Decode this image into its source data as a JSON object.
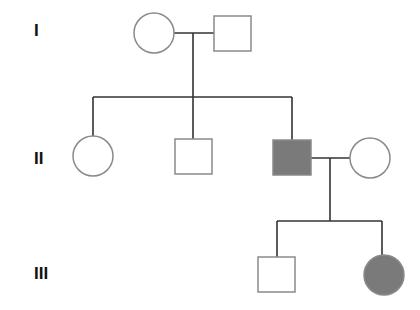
{
  "diagram": {
    "type": "pedigree-chart",
    "colors": {
      "affected_fill": "#7a7a7a",
      "unaffected_fill": "#ffffff",
      "outline": "#8a8a8a",
      "line": "#333333"
    },
    "generations": [
      {
        "label": "I",
        "members": [
          {
            "id": "I-1",
            "sex": "female",
            "shape": "circle",
            "affected": false
          },
          {
            "id": "I-2",
            "sex": "male",
            "shape": "square",
            "affected": false
          }
        ]
      },
      {
        "label": "II",
        "members": [
          {
            "id": "II-1",
            "sex": "female",
            "shape": "circle",
            "affected": false
          },
          {
            "id": "II-2",
            "sex": "male",
            "shape": "square",
            "affected": false
          },
          {
            "id": "II-3",
            "sex": "male",
            "shape": "square",
            "affected": true
          },
          {
            "id": "II-4",
            "sex": "female",
            "shape": "circle",
            "affected": false,
            "married_in": true
          }
        ]
      },
      {
        "label": "III",
        "members": [
          {
            "id": "III-1",
            "sex": "male",
            "shape": "square",
            "affected": false
          },
          {
            "id": "III-2",
            "sex": "female",
            "shape": "circle",
            "affected": true
          }
        ]
      }
    ],
    "relationships": [
      {
        "type": "mating",
        "partners": [
          "I-1",
          "I-2"
        ],
        "children": [
          "II-1",
          "II-2",
          "II-3"
        ]
      },
      {
        "type": "mating",
        "partners": [
          "II-3",
          "II-4"
        ],
        "children": [
          "III-1",
          "III-2"
        ]
      }
    ]
  }
}
